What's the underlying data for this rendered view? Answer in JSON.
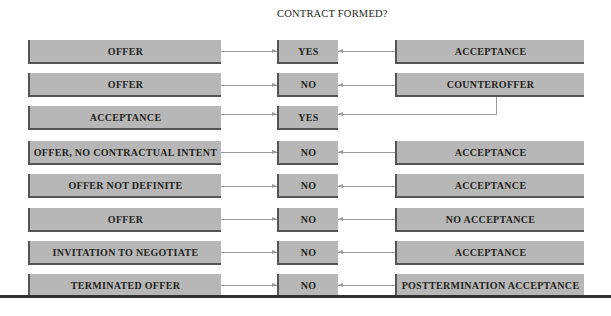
{
  "diagram": {
    "title": "CONTRACT FORMED?",
    "rows": [
      {
        "left": "OFFER",
        "result": "YES",
        "right": "ACCEPTANCE"
      },
      {
        "left": "OFFER",
        "result": "NO",
        "right": "COUNTEROFFER"
      },
      {
        "left": "ACCEPTANCE",
        "result": "YES",
        "right": ""
      },
      {
        "left": "OFFER, NO CONTRACTUAL INTENT",
        "result": "NO",
        "right": "ACCEPTANCE"
      },
      {
        "left": "OFFER NOT DEFINITE",
        "result": "NO",
        "right": "ACCEPTANCE"
      },
      {
        "left": "OFFER",
        "result": "NO",
        "right": "NO ACCEPTANCE"
      },
      {
        "left": "INVITATION TO NEGOTIATE",
        "result": "NO",
        "right": "ACCEPTANCE"
      },
      {
        "left": "TERMINATED OFFER",
        "result": "NO",
        "right": "POSTTERMINATION ACCEPTANCE"
      }
    ],
    "connector_note": "COUNTEROFFER row links down to YES result of ACCEPTANCE row",
    "colors": {
      "box_fill": "#b7b7b7",
      "box_shadow": "#555555",
      "arrow": "#9a9a9a",
      "text": "#231f20"
    }
  }
}
